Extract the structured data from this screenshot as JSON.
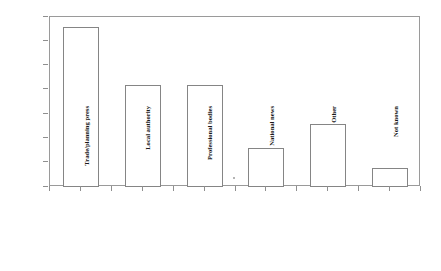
{
  "chart_data": {
    "type": "bar",
    "title": "",
    "subtitle": "",
    "xlabel": "",
    "ylabel": "% of respondents",
    "ylim": [
      0,
      35
    ],
    "ytick_step": 5,
    "yticks": [
      0,
      5,
      10,
      15,
      20,
      25,
      30,
      35
    ],
    "ytick_labels": [
      "0",
      "5",
      "10",
      "15",
      "20",
      "25",
      "30",
      "35"
    ],
    "categories": [
      "Trade/planning press",
      "Local authority",
      "Professional bodies",
      "National news",
      "Other",
      "Not known"
    ],
    "values": [
      33,
      21,
      21,
      8,
      13,
      4
    ],
    "grid": false,
    "legend": false,
    "legend_position": "none",
    "bar_fill": "#ffffff",
    "bar_border": "#858585",
    "axis_color": "#9a9a9a",
    "background": "#ffffff",
    "annotations": []
  },
  "figure": {
    "y_axis_title": "% of respondents"
  }
}
